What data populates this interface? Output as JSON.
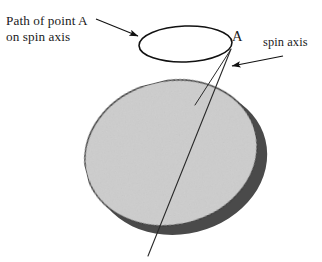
{
  "figure": {
    "width": 322,
    "height": 262,
    "background_color": "#ffffff"
  },
  "labels": {
    "path_of_point_a": "Path of point A\non spin axis",
    "path_of_point_a_line1": "Path of point A",
    "path_of_point_a_line2": "on spin axis",
    "point_a": "A",
    "spin_axis": "spin axis"
  },
  "colors": {
    "line": "#1a1a1a",
    "text": "#1a1a1a",
    "sphere_shadow": "#4a4a4a",
    "sphere_body": "#cdcdcd",
    "sphere_outline": "#2b2b2b",
    "background": "#ffffff"
  },
  "shapes": {
    "precession_circle": {
      "name": "path-of-point-A-ellipse",
      "cx": 185.5,
      "cy": 44,
      "rx": 46.5,
      "ry": 18,
      "rotation": -2,
      "stroke_width": 1.6,
      "fill": "none"
    },
    "sphere_shadow_ellipse": {
      "name": "sphere-shadow",
      "cx": 180,
      "cy": 161,
      "rx": 88,
      "ry": 73,
      "rotation": -14,
      "fill": "#4a4a4a"
    },
    "sphere_body_ellipse": {
      "name": "sphere-body",
      "cx": 171,
      "cy": 153,
      "rx": 87,
      "ry": 72,
      "rotation": -14,
      "fill": "#cdcdcd",
      "stroke": "#2b2b2b",
      "stroke_width": 1.4
    },
    "spin_axis_line": {
      "name": "spin-axis-line",
      "x1": 231,
      "y1": 49,
      "x2": 148,
      "y2": 256,
      "stroke_width": 1.1
    },
    "cone_edge_line": {
      "name": "cone-edge-line",
      "x1": 231,
      "y1": 50,
      "x2": 196,
      "y2": 104,
      "stroke_width": 1.0
    },
    "leader_left": {
      "name": "leader-line-path-of-point-a",
      "x1": 96,
      "y1": 19,
      "x2": 140,
      "y2": 37,
      "stroke_width": 1.1,
      "arrow_at": "end"
    },
    "leader_right": {
      "name": "leader-line-spin-axis",
      "x1": 282,
      "y1": 56,
      "x2": 230,
      "y2": 66,
      "stroke_width": 1.1,
      "arrow_at": "end"
    }
  },
  "annotations": {
    "arrowhead_size": 9,
    "description": "A sphere with a tilted spin axis passing through it; the axis tip traces a small circle (precession path) above the sphere. Point A marks where the spin axis meets the precession circle."
  }
}
